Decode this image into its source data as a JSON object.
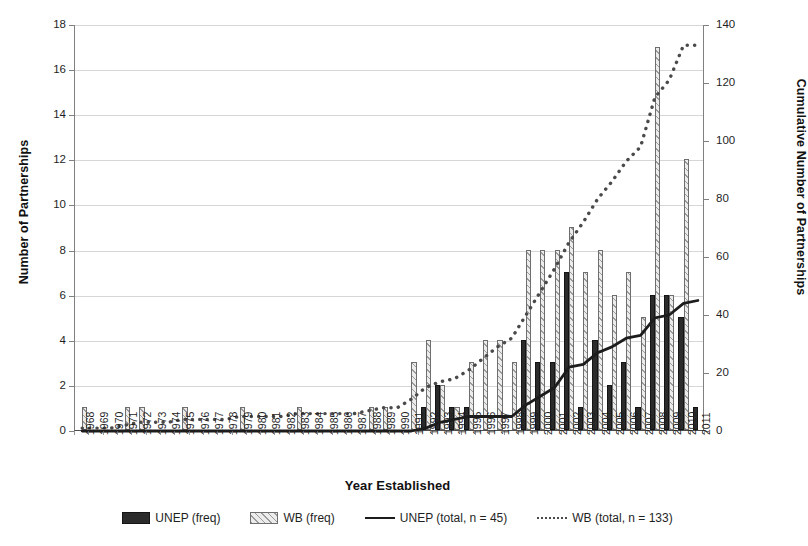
{
  "chart_data": {
    "type": "bar",
    "title": "",
    "xlabel": "Year Established",
    "ylabel": "Number of Partnerships",
    "y2label": "Cumulative Number of Partnerships",
    "ylim": [
      0,
      18
    ],
    "y2lim": [
      0,
      140
    ],
    "yticks": [
      0,
      2,
      4,
      6,
      8,
      10,
      12,
      14,
      16,
      18
    ],
    "y2ticks": [
      0,
      20,
      40,
      60,
      80,
      100,
      120,
      140
    ],
    "grid": true,
    "legend_position": "bottom",
    "categories": [
      "1968",
      "1969",
      "1970",
      "1971",
      "1972",
      "1973",
      "1974",
      "1975",
      "1976",
      "1977",
      "1978",
      "1979",
      "1980",
      "1981",
      "1982",
      "1983",
      "1984",
      "1985",
      "1986",
      "1987",
      "1988",
      "1989",
      "1990",
      "1991",
      "1992",
      "1993",
      "1994",
      "1995",
      "1996",
      "1997",
      "1998",
      "1999",
      "2000",
      "2001",
      "2002",
      "2003",
      "2004",
      "2005",
      "2006",
      "2007",
      "2008",
      "2009",
      "2010",
      "2011"
    ],
    "series": [
      {
        "name": "UNEP (freq)",
        "kind": "bar",
        "axis": "left",
        "color": "#2b2b2b",
        "values": [
          0,
          0,
          0,
          0,
          0,
          0,
          0,
          0,
          0,
          0,
          0,
          0,
          0,
          0,
          0,
          0,
          0,
          0,
          0,
          0,
          0,
          0,
          0,
          0,
          1,
          2,
          1,
          1,
          0,
          0,
          0,
          4,
          3,
          3,
          7,
          1,
          4,
          2,
          3,
          1,
          6,
          6,
          5,
          1
        ]
      },
      {
        "name": "WB (freq)",
        "kind": "bar",
        "axis": "left",
        "color": "#ececec",
        "values": [
          1,
          0,
          0,
          1,
          1,
          0,
          0,
          1,
          0,
          0,
          0,
          1,
          0,
          0,
          0,
          1,
          0,
          0,
          0,
          0,
          1,
          1,
          0,
          3,
          4,
          2,
          1,
          3,
          4,
          4,
          3,
          8,
          8,
          8,
          9,
          7,
          8,
          6,
          7,
          5,
          17,
          6,
          12,
          0
        ]
      },
      {
        "name": "UNEP (total, n = 45)",
        "kind": "line",
        "axis": "right",
        "color": "#1c1c1c",
        "style": "solid",
        "values": [
          0,
          0,
          0,
          0,
          0,
          0,
          0,
          0,
          0,
          0,
          0,
          0,
          0,
          0,
          0,
          0,
          0,
          0,
          0,
          0,
          0,
          0,
          0,
          0,
          1,
          3,
          4,
          5,
          5,
          5,
          5,
          9,
          12,
          15,
          22,
          23,
          27,
          29,
          32,
          33,
          39,
          40,
          44,
          45
        ]
      },
      {
        "name": "WB (total, n = 133)",
        "kind": "line",
        "axis": "right",
        "color": "#4a4a4a",
        "style": "dotted",
        "values": [
          1,
          1,
          1,
          2,
          3,
          3,
          3,
          4,
          4,
          4,
          4,
          5,
          5,
          5,
          5,
          6,
          6,
          6,
          6,
          6,
          7,
          8,
          8,
          11,
          15,
          17,
          18,
          21,
          25,
          29,
          32,
          40,
          48,
          56,
          65,
          72,
          80,
          86,
          93,
          98,
          115,
          121,
          133,
          133
        ]
      }
    ]
  },
  "legend": {
    "items": [
      {
        "label": "UNEP (freq)",
        "swatch": "unep-bar-swatch"
      },
      {
        "label": "WB (freq)",
        "swatch": "wb-bar-swatch"
      },
      {
        "label": "UNEP (total, n = 45)",
        "swatch": "unep-line-swatch"
      },
      {
        "label": "WB (total, n = 133)",
        "swatch": "wb-line-swatch"
      }
    ]
  }
}
